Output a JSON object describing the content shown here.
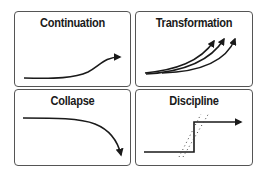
{
  "diagram": {
    "panels": [
      {
        "id": "continuation",
        "title": "Continuation",
        "icon": "gently-rising-curve-arrow"
      },
      {
        "id": "transformation",
        "title": "Transformation",
        "icon": "three-diverging-rising-arrows"
      },
      {
        "id": "collapse",
        "title": "Collapse",
        "icon": "falling-curve-arrow"
      },
      {
        "id": "discipline",
        "title": "Discipline",
        "icon": "step-up-arrow-with-dotted-band"
      }
    ],
    "colors": {
      "stroke": "#1a1a1a",
      "border": "#555555",
      "background": "#ffffff"
    }
  }
}
